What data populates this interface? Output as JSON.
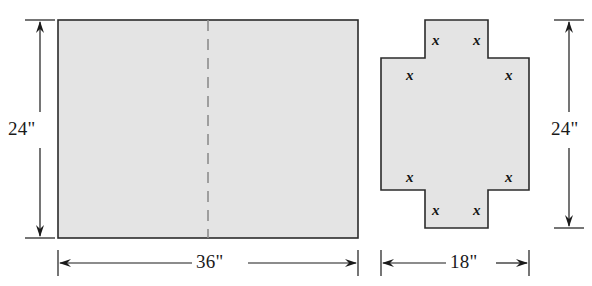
{
  "figure": {
    "background_color": "#ffffff",
    "shape_fill_color": "#e4e4e4",
    "shape_stroke_color": "#2b2b2b",
    "dimension_line_color": "#1a1a1a",
    "dashed_line_color": "#8a8a8a"
  },
  "left_figure": {
    "name": "rectangular-sheet",
    "shape": "rectangle",
    "fold_line": "vertical dashed center line",
    "dimensions": {
      "height_label": "24\"",
      "width_label": "36\"",
      "height_value": 24,
      "width_value": 36,
      "unit": "inches"
    }
  },
  "right_figure": {
    "name": "cross-shaped-pattern",
    "shape": "greek cross (plus)",
    "dimensions": {
      "height_label": "24\"",
      "width_label": "18\"",
      "height_value": 24,
      "width_value": 18,
      "unit": "inches"
    },
    "corner_variable": "x",
    "corner_labels": [
      "x",
      "x",
      "x",
      "x",
      "x",
      "x",
      "x",
      "x"
    ],
    "corner_label_count": 8
  }
}
